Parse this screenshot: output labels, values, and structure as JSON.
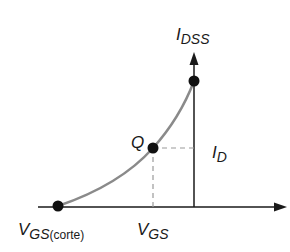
{
  "diagram": {
    "labels": {
      "idss_main": "I",
      "idss_sub": "DSS",
      "id_main": "I",
      "id_sub": "D",
      "q_point": "Q",
      "vgs_main": "V",
      "vgs_sub": "GS",
      "vgs_cutoff_main": "V",
      "vgs_cutoff_sub": "GS",
      "vgs_cutoff_suffix": "(corte)"
    },
    "colors": {
      "axis": "#1a1a1a",
      "curve": "#8a8a8a",
      "dashed": "#9a9a9a",
      "points": "#111111"
    },
    "points": [
      {
        "name": "IDSS",
        "x": 194,
        "y": 81
      },
      {
        "name": "Q",
        "x": 153,
        "y": 148
      },
      {
        "name": "VGS(corte)",
        "x": 58,
        "y": 206
      }
    ]
  }
}
